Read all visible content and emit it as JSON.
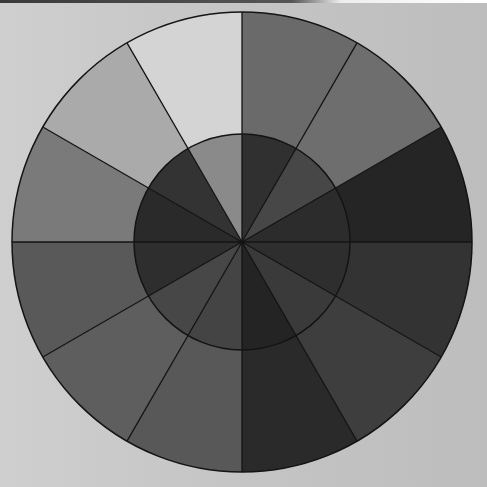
{
  "image": {
    "description": "Grayscale photograph of a 12-segment color wheel with an inner ring of 12 segments",
    "background_color": "#c9c9c9"
  },
  "wheel": {
    "center": [
      242,
      242
    ],
    "outer_radius": 230,
    "inner_radius": 108,
    "segment_count": 12,
    "stroke_color": "#141414",
    "outer_ring_colors": [
      "#6a6a6a",
      "#6e6e6e",
      "#252525",
      "#333333",
      "#3e3e3e",
      "#2a2a2a",
      "#585858",
      "#5e5e5e",
      "#595959",
      "#7a7a7a",
      "#aaaaaa",
      "#d4d4d4"
    ],
    "inner_ring_colors": [
      "#303030",
      "#474747",
      "#2c2c2c",
      "#2e2e2e",
      "#3a3a3a",
      "#242424",
      "#444444",
      "#474747",
      "#2e2e2e",
      "#2a2a2a",
      "#333333",
      "#8a8a8a"
    ]
  }
}
